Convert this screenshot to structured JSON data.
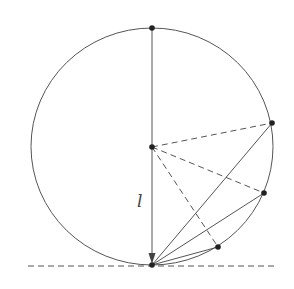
{
  "diagram": {
    "type": "geometry",
    "colors": {
      "stroke": "#555555",
      "point": "#222222",
      "background": "#ffffff"
    },
    "circle": {
      "cx": 152,
      "cy": 146.5,
      "rx": 121,
      "ry": 118.5
    },
    "points": {
      "top": {
        "x": 152,
        "y": 28
      },
      "center": {
        "x": 152,
        "y": 147
      },
      "bottom": {
        "x": 152,
        "y": 265
      },
      "A": {
        "x": 272,
        "y": 123
      },
      "B": {
        "x": 264,
        "y": 193
      },
      "C": {
        "x": 218,
        "y": 247
      }
    },
    "label_l": "l",
    "tangent_line": {
      "x1": 28,
      "y1": 266,
      "x2": 278,
      "y2": 266,
      "style": "dashed"
    }
  }
}
